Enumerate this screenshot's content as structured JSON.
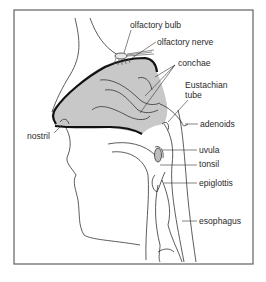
{
  "diagram": {
    "labels": {
      "olfactory_bulb": "olfactory bulb",
      "olfactory_nerve": "olfactory nerve",
      "conchae": "conchae",
      "eustachian_tube_line1": "Eustachian",
      "eustachian_tube_line2": "tube",
      "adenoids": "adenoids",
      "nostril": "nostril",
      "uvula": "uvula",
      "tonsil": "tonsil",
      "epiglottis": "epiglottis",
      "esophagus": "esophagus"
    },
    "colors": {
      "nasal_cavity_fill": "#c8c8c8",
      "outline": "#1a1a1a",
      "frame": "#6e6e6e",
      "background": "#ffffff"
    }
  }
}
